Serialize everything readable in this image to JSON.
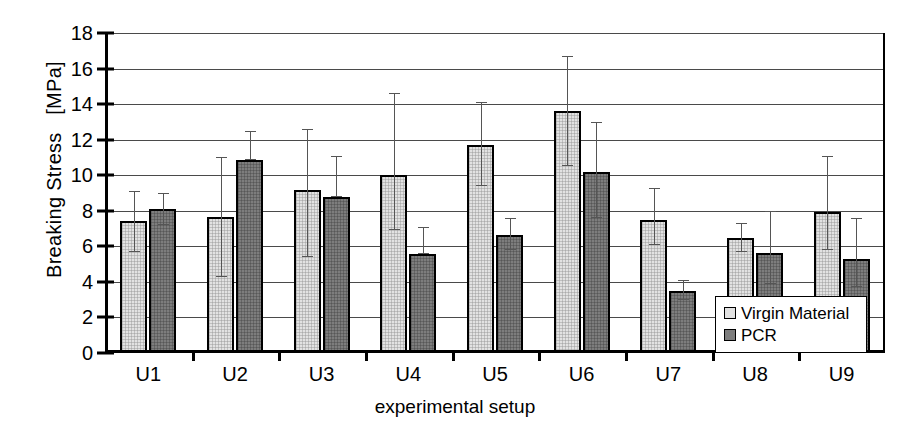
{
  "chart_data": {
    "type": "bar",
    "title": "",
    "xlabel": "experimental setup",
    "ylabel": "Breaking Stress   [MPa]",
    "categories": [
      "U1",
      "U2",
      "U3",
      "U4",
      "U5",
      "U6",
      "U7",
      "U8",
      "U9"
    ],
    "ylim": [
      0,
      18
    ],
    "yticks": [
      0,
      2,
      4,
      6,
      8,
      10,
      12,
      14,
      16,
      18
    ],
    "grid": true,
    "legend_position": "bottom-right",
    "series": [
      {
        "name": "Virgin Material",
        "color": "#e2e2e2",
        "values": [
          7.4,
          7.65,
          9.15,
          10.0,
          11.7,
          13.6,
          7.5,
          6.45,
          7.95
        ],
        "error_low": [
          5.7,
          4.3,
          5.4,
          6.9,
          9.4,
          10.5,
          6.1,
          5.7,
          5.8
        ],
        "error_high": [
          9.1,
          11.0,
          12.6,
          14.6,
          14.1,
          16.7,
          9.3,
          7.3,
          11.1
        ]
      },
      {
        "name": "PCR",
        "color": "#7d7d7d",
        "values": [
          8.1,
          10.85,
          8.8,
          5.55,
          6.65,
          10.2,
          3.5,
          5.6,
          5.3
        ],
        "error_low": [
          7.2,
          10.85,
          8.8,
          5.55,
          5.8,
          7.6,
          3.0,
          3.9,
          3.7
        ],
        "error_high": [
          9.0,
          12.5,
          11.1,
          7.1,
          7.6,
          13.0,
          4.1,
          8.0,
          7.6
        ]
      }
    ]
  },
  "legend": {
    "items": [
      {
        "label": "Virgin Material",
        "swatch": "light"
      },
      {
        "label": "PCR",
        "swatch": "dark"
      }
    ]
  }
}
